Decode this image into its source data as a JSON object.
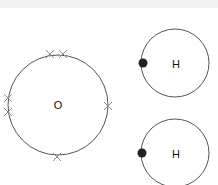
{
  "diagram": {
    "type": "dot-and-cross",
    "atoms": [
      {
        "symbol": "O",
        "label": "O",
        "cx": 58,
        "cy": 105,
        "r": 50,
        "electrons": [
          {
            "type": "cross",
            "x": 50,
            "y": 54
          },
          {
            "type": "cross",
            "x": 63,
            "y": 54
          },
          {
            "type": "cross",
            "x": 8,
            "y": 98
          },
          {
            "type": "cross",
            "x": 8,
            "y": 112
          },
          {
            "type": "cross",
            "x": 108,
            "y": 106
          },
          {
            "type": "cross",
            "x": 57,
            "y": 157
          }
        ]
      },
      {
        "symbol": "H",
        "label": "H",
        "cx": 175,
        "cy": 63,
        "r": 34,
        "electrons": [
          {
            "type": "dot",
            "x": 143,
            "y": 63
          }
        ]
      },
      {
        "symbol": "H",
        "label": "H",
        "cx": 175,
        "cy": 153,
        "r": 34,
        "electrons": [
          {
            "type": "dot",
            "x": 142,
            "y": 153
          }
        ]
      }
    ],
    "colors": {
      "shell": "#555555",
      "cross": "#8a8a8a",
      "dot": "#222222",
      "text": "#111111",
      "topband": "#f1f1f1"
    }
  }
}
